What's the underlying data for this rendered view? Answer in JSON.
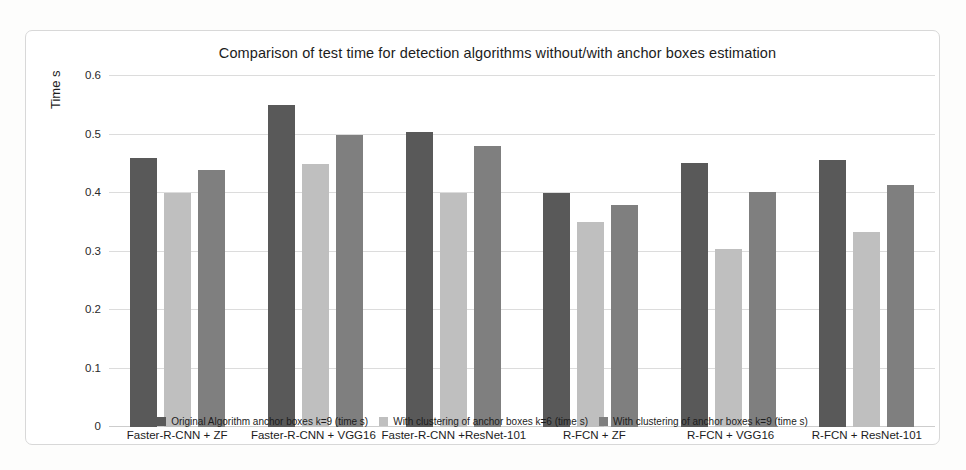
{
  "chart_data": {
    "type": "bar",
    "title": "Comparison of test time for detection algorithms without/with anchor boxes estimation",
    "xlabel": "",
    "ylabel": "Time s",
    "ylim": [
      0,
      0.6
    ],
    "yticks": [
      "0",
      "0.1",
      "0.2",
      "0.3",
      "0.4",
      "0.5",
      "0.6"
    ],
    "ytick_values": [
      0,
      0.1,
      0.2,
      0.3,
      0.4,
      0.5,
      0.6
    ],
    "grid": true,
    "legend_position": "bottom",
    "categories": [
      "Faster-R-CNN + ZF",
      "Faster-R-CNN + VGG16",
      "Faster-R-CNN +ResNet-101",
      "R-FCN + ZF",
      "R-FCN + VGG16",
      "R-FCN + ResNet-101"
    ],
    "series": [
      {
        "name": "Original Algorithm anchor boxes k=9 (time s)",
        "color": "#595959",
        "values": [
          0.46,
          0.55,
          0.505,
          0.4,
          0.452,
          0.456
        ]
      },
      {
        "name": "With clustering of anchor boxes k=6 (time s)",
        "color": "#bfbfbf",
        "values": [
          0.4,
          0.45,
          0.4,
          0.35,
          0.305,
          0.333
        ]
      },
      {
        "name": "With clustering of anchor boxes k=9 (time s)",
        "color": "#7f7f7f",
        "values": [
          0.44,
          0.5,
          0.48,
          0.38,
          0.402,
          0.413
        ]
      }
    ]
  }
}
